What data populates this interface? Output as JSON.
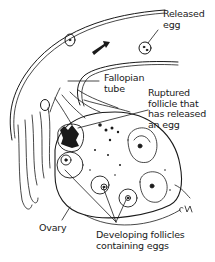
{
  "diagram": {
    "type": "anatomical-illustration",
    "labels": {
      "released_egg": "Released\negg",
      "fallopian_tube": "Fallopian\ntube",
      "ruptured_follicle": "Ruptured\nfollicle that\nhas released\nan egg",
      "ovary": "Ovary",
      "developing_follicles": "Developing follicles\ncontaining eggs"
    },
    "signature": "CM",
    "colors": {
      "ink": "#1a1a1a",
      "background": "#ffffff"
    }
  }
}
